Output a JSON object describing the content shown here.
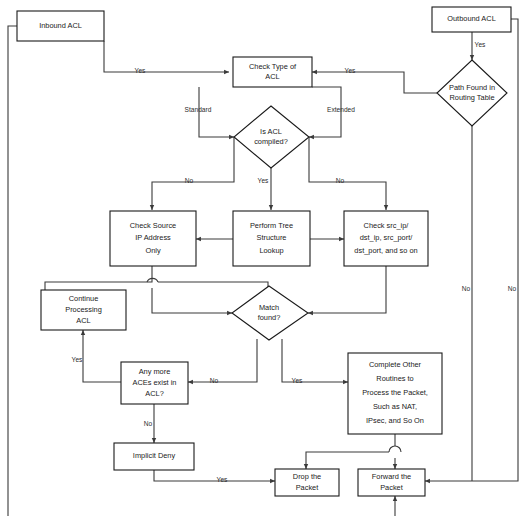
{
  "diagram": {
    "type": "flowchart",
    "background": "#ffffff",
    "stroke_color": "#1a1a1a",
    "line_color": "#3a3a3a",
    "nodes": [
      {
        "id": "inbound_acl",
        "shape": "rect",
        "label": "Inbound ACL",
        "lines": [
          "Inbound ACL"
        ]
      },
      {
        "id": "outbound_acl",
        "shape": "rect",
        "label": "Outbound ACL",
        "lines": [
          "Outbound ACL"
        ]
      },
      {
        "id": "check_type",
        "shape": "rect",
        "label": "Check Type of ACL",
        "lines": [
          "Check Type of",
          "ACL"
        ]
      },
      {
        "id": "path_found",
        "shape": "diamond",
        "label": "Path Found in Routing Table",
        "lines": [
          "Path Found in",
          "Routing Table"
        ]
      },
      {
        "id": "is_compiled",
        "shape": "diamond",
        "label": "Is ACL compiled?",
        "lines": [
          "Is ACL",
          "compiled?"
        ]
      },
      {
        "id": "check_source_ip",
        "shape": "rect",
        "label": "Check Source IP Address Only",
        "lines": [
          "Check Source",
          "IP Address",
          "Only"
        ]
      },
      {
        "id": "perform_tree",
        "shape": "rect",
        "label": "Perform Tree Structure Lookup",
        "lines": [
          "Perform Tree",
          "Structure",
          "Lookup"
        ]
      },
      {
        "id": "check_srcip",
        "shape": "rect",
        "label": "Check src_ip/dst_ip, src_port/dst_port, and so on",
        "lines": [
          "Check src_ip/",
          "dst_ip, src_port/",
          "dst_port, and so on"
        ]
      },
      {
        "id": "continue_acl",
        "shape": "rect",
        "label": "Continue Processing ACL",
        "lines": [
          "Continue",
          "Processing",
          "ACL"
        ]
      },
      {
        "id": "match_found",
        "shape": "diamond",
        "label": "Match found?",
        "lines": [
          "Match",
          "found?"
        ]
      },
      {
        "id": "any_more_aces",
        "shape": "rect",
        "label": "Any more ACEs exist in ACL?",
        "lines": [
          "Any more",
          "ACEs exist in",
          "ACL?"
        ]
      },
      {
        "id": "complete_other",
        "shape": "rect",
        "label": "Complete Other Routines to Process the Packet, Such as NAT, IPsec, and So On",
        "lines": [
          "Complete Other",
          "Routines to",
          "Process the Packet,",
          "Such as NAT,",
          "IPsec, and So On"
        ]
      },
      {
        "id": "implicit_deny",
        "shape": "rect",
        "label": "Implicit Deny",
        "lines": [
          "Implicit Deny"
        ]
      },
      {
        "id": "drop_packet",
        "shape": "rect",
        "label": "Drop the Packet",
        "lines": [
          "Drop the",
          "Packet"
        ]
      },
      {
        "id": "forward_packet",
        "shape": "rect",
        "label": "Forward the Packet",
        "lines": [
          "Forward the",
          "Packet"
        ]
      }
    ],
    "edge_labels": [
      {
        "id": "e_inbound_yes",
        "text": "Yes",
        "from": "inbound_acl",
        "to": "check_type"
      },
      {
        "id": "e_outbound_yes",
        "text": "Yes",
        "from": "outbound_acl",
        "to": "path_found"
      },
      {
        "id": "e_pathfound_yes",
        "text": "Yes",
        "from": "path_found",
        "to": "check_type"
      },
      {
        "id": "e_pathfound_no",
        "text": "No",
        "from": "path_found",
        "to": "forward_packet"
      },
      {
        "id": "e_standard",
        "text": "Standard",
        "from": "check_type",
        "to": "is_compiled"
      },
      {
        "id": "e_extended",
        "text": "Extended",
        "from": "check_type",
        "to": "is_compiled"
      },
      {
        "id": "e_compiled_no_l",
        "text": "No",
        "from": "is_compiled",
        "to": "check_source_ip"
      },
      {
        "id": "e_compiled_yes",
        "text": "Yes",
        "from": "is_compiled",
        "to": "perform_tree"
      },
      {
        "id": "e_compiled_no_r",
        "text": "No",
        "from": "is_compiled",
        "to": "check_srcip"
      },
      {
        "id": "e_match_no",
        "text": "No",
        "from": "match_found",
        "to": "any_more_aces"
      },
      {
        "id": "e_match_yes",
        "text": "Yes",
        "from": "match_found",
        "to": "complete_other"
      },
      {
        "id": "e_aces_yes",
        "text": "Yes",
        "from": "any_more_aces",
        "to": "continue_acl"
      },
      {
        "id": "e_aces_no",
        "text": "No",
        "from": "any_more_aces",
        "to": "implicit_deny"
      },
      {
        "id": "e_deny_yes",
        "text": "Yes",
        "from": "implicit_deny",
        "to": "drop_packet"
      },
      {
        "id": "e_left_no",
        "text": "No",
        "from": "outbound_acl",
        "to": "check_type"
      }
    ]
  }
}
